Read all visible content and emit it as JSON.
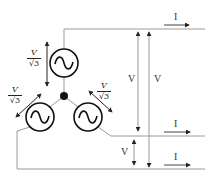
{
  "diagram": {
    "type": "three-phase star (wye) connected generator",
    "phase_voltage_label": {
      "numerator": "V",
      "denominator": "√3"
    },
    "line_voltage_label": "V",
    "line_current_label": "I",
    "generators": [
      {
        "id": "top",
        "symbol": "~"
      },
      {
        "id": "bottom-left",
        "symbol": "~"
      },
      {
        "id": "bottom-right",
        "symbol": "~"
      }
    ],
    "labels": {
      "phase_top": {
        "num": "V",
        "den": "√3"
      },
      "phase_left": {
        "num": "V",
        "den": "√3"
      },
      "phase_right": {
        "num": "V",
        "den": "√3"
      },
      "line_v1": "V",
      "line_v2": "V",
      "line_v3": "V",
      "current_top": "I",
      "current_mid": "I",
      "current_bottom": "I"
    },
    "colors": {
      "wire": "#999999",
      "symbol": "#111111",
      "arrow": "#222222"
    }
  }
}
